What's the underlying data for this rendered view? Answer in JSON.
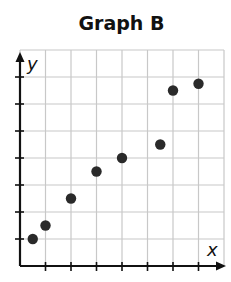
{
  "chart_data": {
    "type": "scatter",
    "title": "Graph B",
    "xlabel": "x",
    "ylabel": "y",
    "xlim": [
      0,
      8
    ],
    "ylim": [
      0,
      8
    ],
    "grid": true,
    "tick_labels": false,
    "x_ticks": [
      1,
      2,
      3,
      4,
      5,
      6,
      7
    ],
    "y_ticks": [
      1,
      2,
      3,
      4,
      5,
      6,
      7
    ],
    "points": [
      {
        "x": 0.5,
        "y": 1.0
      },
      {
        "x": 1.0,
        "y": 1.5
      },
      {
        "x": 2.0,
        "y": 2.5
      },
      {
        "x": 3.0,
        "y": 3.5
      },
      {
        "x": 4.0,
        "y": 4.0
      },
      {
        "x": 5.5,
        "y": 4.5
      },
      {
        "x": 6.0,
        "y": 6.5
      },
      {
        "x": 7.0,
        "y": 6.75
      }
    ],
    "colors": {
      "points": "#2a2a2a",
      "grid": "#c8c8c8",
      "axes": "#111111"
    }
  },
  "labels": {
    "title": "Graph B",
    "x_axis": "x",
    "y_axis": "y"
  }
}
